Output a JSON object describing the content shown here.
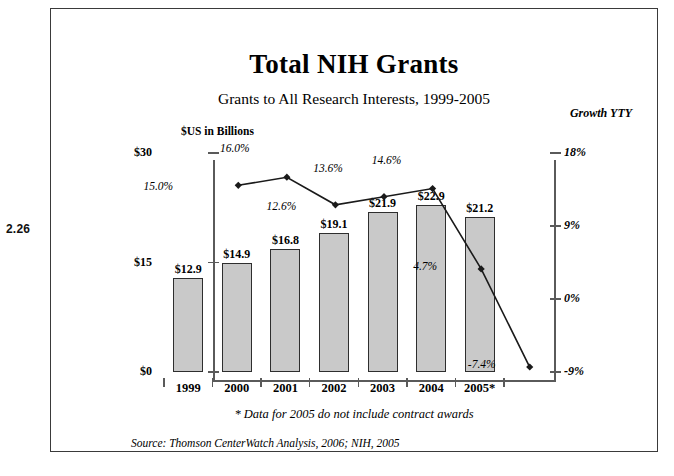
{
  "figure_number": "2.26",
  "chart_data": {
    "type": "bar",
    "title": "Total NIH Grants",
    "subtitle": "Grants to All Research Interests, 1999-2005",
    "categories": [
      "1999",
      "2000",
      "2001",
      "2002",
      "2003",
      "2004",
      "2005*"
    ],
    "xlabel": "",
    "ylabel": "$US in Billions",
    "ylim": [
      0,
      30
    ],
    "y_ticks": [
      "$0",
      "$15",
      "$30"
    ],
    "y2label": "Growth YTY",
    "y2lim": [
      -9,
      18
    ],
    "y2_ticks": [
      "-9%",
      "0%",
      "9%",
      "18%"
    ],
    "grid": false,
    "legend": "none",
    "series": [
      {
        "name": "Total NIH Grants ($US in Billions)",
        "type": "bar",
        "values": [
          12.9,
          14.9,
          16.8,
          19.1,
          21.9,
          22.9,
          21.2
        ],
        "value_labels": [
          "$12.9",
          "$14.9",
          "$16.8",
          "$19.1",
          "$21.9",
          "$22.9",
          "$21.2"
        ],
        "color": "#c9c9c9",
        "border_color": "#2e2e2e"
      },
      {
        "name": "Growth YTY",
        "type": "line",
        "axis": "right",
        "values": [
          15.0,
          16.0,
          12.6,
          13.6,
          14.6,
          4.7,
          -7.4
        ],
        "value_labels": [
          "15.0%",
          "16.0%",
          "12.6%",
          "13.6%",
          "14.6%",
          "4.7%",
          "-7.4%"
        ],
        "color": "#1a1a1a",
        "marker": "diamond"
      }
    ]
  },
  "notes": {
    "footnote": "* Data for 2005 do not include contract awards",
    "source": "Source:  Thomson CenterWatch Analysis, 2006; NIH, 2005"
  }
}
